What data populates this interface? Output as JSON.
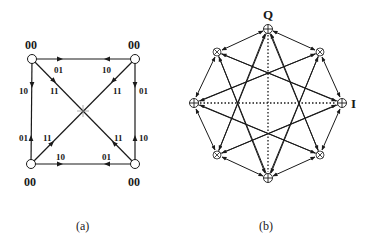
{
  "panel_a": {
    "caption": "(a)",
    "node_label": "00",
    "nodes": [
      {
        "id": "tl",
        "label": "00"
      },
      {
        "id": "tr",
        "label": "00"
      },
      {
        "id": "bl",
        "label": "00"
      },
      {
        "id": "br",
        "label": "00"
      }
    ],
    "edge_labels": {
      "top_left": "01",
      "top_right": "10",
      "left_top": "10",
      "left_bottom": "01",
      "right_top": "01",
      "right_bottom": "10",
      "bottom_left": "10",
      "bottom_right": "01",
      "diag_tl": "11",
      "diag_tr": "11",
      "diag_bl": "11",
      "diag_br": "11"
    }
  },
  "panel_b": {
    "caption": "(b)",
    "axis_q": "Q",
    "axis_i": "I",
    "node_types": {
      "axis": "circle-plus",
      "diagonal": "circle-times"
    }
  },
  "colors": {
    "line": "#1a1a1a",
    "background": "#ffffff"
  }
}
